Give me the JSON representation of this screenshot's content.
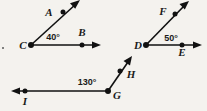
{
  "figure": {
    "background_color": "#f4f2ee",
    "ink_color": "#111111",
    "degree_symbol": "°",
    "diagrams": [
      {
        "id": "angle-acb",
        "vertex": "C",
        "angle_measure": "40°",
        "rays": [
          {
            "name": "ray-ca",
            "through_point": "A",
            "direction": "up-right"
          },
          {
            "name": "ray-cb",
            "through_point": "B",
            "direction": "right"
          }
        ],
        "labels": {
          "vertex": "C",
          "point_upper": "A",
          "point_lower": "B",
          "angle": "40°"
        }
      },
      {
        "id": "angle-fde",
        "vertex": "D",
        "angle_measure": "50°",
        "rays": [
          {
            "name": "ray-df",
            "through_point": "F",
            "direction": "up-right"
          },
          {
            "name": "ray-de",
            "through_point": "E",
            "direction": "right"
          }
        ],
        "labels": {
          "vertex": "D",
          "point_upper": "F",
          "point_lower": "E",
          "angle": "50°"
        }
      },
      {
        "id": "angle-hgi",
        "vertex": "G",
        "angle_measure": "130°",
        "rays": [
          {
            "name": "ray-gh",
            "through_point": "H",
            "direction": "up-right"
          },
          {
            "name": "ray-gi",
            "through_point": "I",
            "direction": "left"
          }
        ],
        "labels": {
          "vertex": "G",
          "point_upper": "H",
          "point_lower": "I",
          "angle": "130°"
        }
      }
    ]
  }
}
